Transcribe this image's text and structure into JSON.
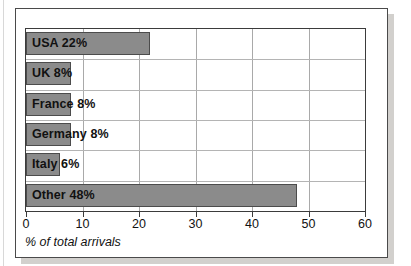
{
  "figure": {
    "frame_border_color": "#4a4a4a",
    "shadow_color": "#d2d0cd",
    "background": "#ffffff"
  },
  "chart_data": {
    "type": "bar",
    "orientation": "horizontal",
    "title": "",
    "subtitle": "",
    "xlabel": "% of total arrivals",
    "ylabel": "",
    "categories": [
      "USA",
      "UK",
      "France",
      "Germany",
      "Italy",
      "Other"
    ],
    "values": [
      22,
      8,
      8,
      8,
      6,
      48
    ],
    "value_suffix": "%",
    "bar_labels": [
      "USA 22%",
      "UK 8%",
      "France 8%",
      "Germany 8%",
      "Italy 6%",
      "Other 48%"
    ],
    "xlim": [
      0,
      60
    ],
    "xticks": [
      0,
      10,
      20,
      30,
      40,
      50,
      60
    ],
    "xtick_labels": [
      "0",
      "10",
      "20",
      "30",
      "40",
      "50",
      "60"
    ],
    "grid": true,
    "grid_axis": "both",
    "legend": false,
    "legend_position": "none",
    "bar_fill_color": "#8b8b8b",
    "bar_edge_color": "#4c4c4c",
    "grid_color": "#a9a9a9",
    "axis_color": "#3b3b3b",
    "label_text_color": "#111111"
  }
}
